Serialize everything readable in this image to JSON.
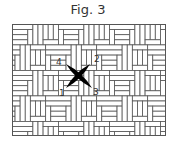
{
  "figure": {
    "title": "Fig. 3",
    "grid": {
      "x": 12.5,
      "y": 24.5,
      "width": 153,
      "height": 111,
      "cell": 5.1,
      "line_color": "#555555",
      "fill_color": "#ffffff"
    },
    "cross_stitch": {
      "color": "#000000",
      "stroke_1_3": {
        "from": [
          66,
          64
        ],
        "to": [
          92,
          88
        ]
      },
      "stroke_2_4": {
        "from": [
          90,
          64
        ],
        "to": [
          66,
          88
        ]
      }
    },
    "labels": [
      {
        "text": "4",
        "x": 56,
        "y": 65
      },
      {
        "text": "2",
        "x": 94,
        "y": 62
      },
      {
        "text": "1",
        "x": 59,
        "y": 96
      },
      {
        "text": "3",
        "x": 93,
        "y": 95
      }
    ]
  }
}
